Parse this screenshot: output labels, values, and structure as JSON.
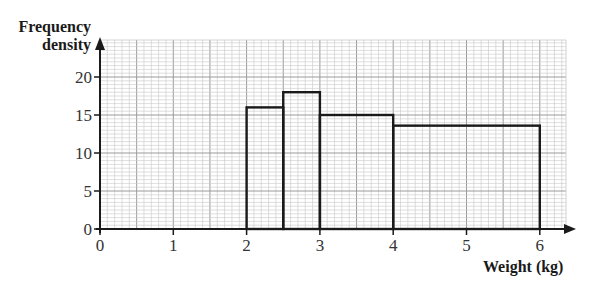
{
  "chart_data": {
    "type": "bar",
    "subtype": "histogram",
    "title": "",
    "xlabel": "Weight (kg)",
    "ylabel": "Frequency density",
    "ylabel_lines": [
      "Frequency",
      "density"
    ],
    "xlim": [
      0,
      6.45
    ],
    "ylim": [
      0,
      25
    ],
    "x_ticks": [
      0,
      1,
      2,
      3,
      4,
      5,
      6
    ],
    "y_ticks": [
      0,
      5,
      10,
      15,
      20
    ],
    "grid": true,
    "legend": null,
    "bins": [
      {
        "x_start": 2,
        "x_end": 2.5,
        "frequency_density": 16
      },
      {
        "x_start": 2.5,
        "x_end": 3,
        "frequency_density": 18
      },
      {
        "x_start": 3,
        "x_end": 4,
        "frequency_density": 15
      },
      {
        "x_start": 4,
        "x_end": 6,
        "frequency_density": 13.6
      }
    ],
    "categories": [
      "2–2.5",
      "2.5–3",
      "3–4",
      "4–6"
    ],
    "values": [
      16,
      18,
      15,
      13.6
    ]
  },
  "colors": {
    "axis": "#1a1a1a",
    "bar_outline": "#1a1a1a",
    "grid_minor": "#c8c8c8",
    "grid_major": "#9a9a9a"
  }
}
